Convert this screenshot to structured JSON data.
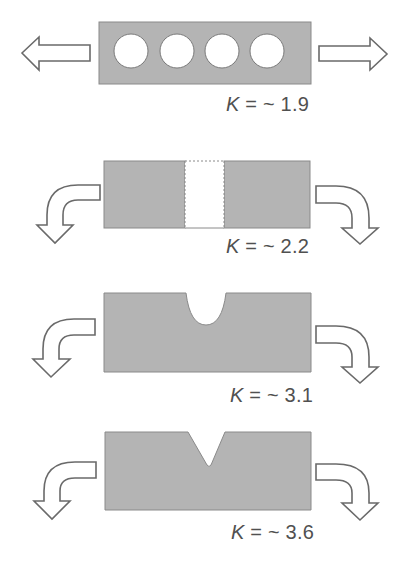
{
  "figure": {
    "colors": {
      "plate_fill": "#b4b4b4",
      "plate_edge": "#8a8a8a",
      "arrow_stroke": "#6a6a6a",
      "label_text": "#505050"
    },
    "panels": [
      {
        "id": "row-of-holes",
        "loading": "axial tension",
        "feature": "four circular holes",
        "label": {
          "symbol": "K",
          "relation": " = ~ ",
          "value": "1.9"
        }
      },
      {
        "id": "rectangular-slot",
        "loading": "bending",
        "feature": "full-depth rectangular cut",
        "label": {
          "symbol": "K",
          "relation": " = ~ ",
          "value": "2.2"
        }
      },
      {
        "id": "u-notch",
        "loading": "bending",
        "feature": "semicircular U-notch",
        "label": {
          "symbol": "K",
          "relation": " = ~ ",
          "value": "3.1"
        }
      },
      {
        "id": "v-notch",
        "loading": "bending",
        "feature": "sharp V-notch",
        "label": {
          "symbol": "K",
          "relation": " = ~ ",
          "value": "3.6"
        }
      }
    ],
    "icons": {
      "axial_arrow": "hollow-block-arrow-icon",
      "bending_arrow": "hollow-curved-arrow-icon"
    }
  }
}
